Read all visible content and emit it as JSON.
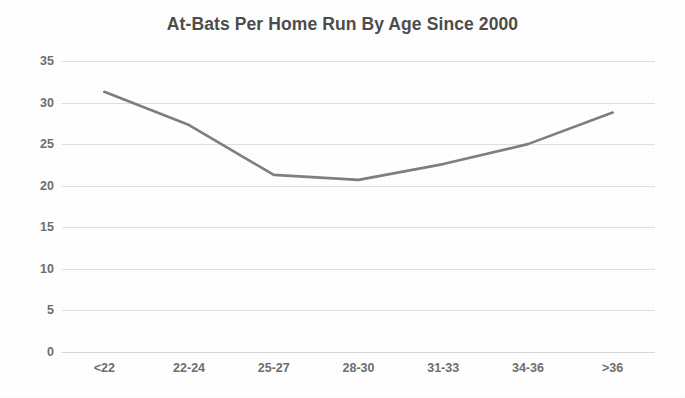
{
  "chart_data": {
    "type": "line",
    "title": "At-Bats Per Home Run By Age Since 2000",
    "xlabel": "",
    "ylabel": "",
    "categories": [
      "<22",
      "22-24",
      "25-27",
      "28-30",
      "31-33",
      "34-36",
      ">36"
    ],
    "values": [
      31.3,
      27.3,
      21.3,
      20.7,
      22.6,
      25.0,
      28.8
    ],
    "series": [
      {
        "name": "At-Bats Per Home Run",
        "values": [
          31.3,
          27.3,
          21.3,
          20.7,
          22.6,
          25.0,
          28.8
        ]
      }
    ],
    "ylim": [
      0,
      35
    ],
    "yticks": [
      0,
      5,
      10,
      15,
      20,
      25,
      30,
      35
    ],
    "ytick_labels": [
      "0",
      "5",
      "10",
      "15",
      "20",
      "25",
      "30",
      "35"
    ],
    "grid": true,
    "grid_axis": "y",
    "legend": false,
    "legend_position": "none",
    "markers": false,
    "line_color": "#7f7f7f",
    "grid_color": "#dcdcdc",
    "text_color": "#6e6e6e",
    "title_color": "#4d4d4d",
    "background_color": "#ffffff"
  }
}
